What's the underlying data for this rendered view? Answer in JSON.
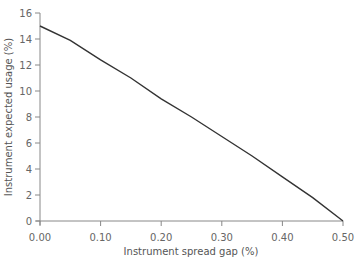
{
  "chart_data": {
    "type": "line",
    "title": "",
    "xlabel": "Instrument spread gap (%)",
    "ylabel": "Instrument expected usage (%)",
    "xlim": [
      0,
      0.5
    ],
    "ylim": [
      0,
      16
    ],
    "grid": false,
    "legend": null,
    "x_ticks": [
      "0.00",
      "0.10",
      "0.20",
      "0.30",
      "0.40",
      "0.50"
    ],
    "y_ticks": [
      "0",
      "2",
      "4",
      "6",
      "8",
      "10",
      "12",
      "14",
      "16"
    ],
    "series": [
      {
        "name": "Expected usage",
        "x": [
          0.0,
          0.05,
          0.1,
          0.15,
          0.2,
          0.25,
          0.3,
          0.35,
          0.4,
          0.45,
          0.5
        ],
        "values": [
          15.0,
          13.9,
          12.4,
          11.0,
          9.4,
          8.0,
          6.5,
          5.0,
          3.4,
          1.8,
          0.0
        ]
      }
    ]
  }
}
